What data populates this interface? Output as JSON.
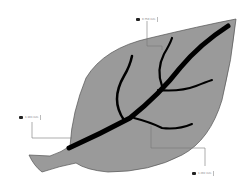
{
  "diagram": {
    "colors": {
      "leaf_fill": "#9a9a9a",
      "leaf_outline": "#555555",
      "veins": "#000000",
      "connector": "#777777"
    },
    "callouts": [
      {
        "id": "top",
        "value": "0.750 mm",
        "icon": "camera-icon"
      },
      {
        "id": "left",
        "value": "1.103 mm",
        "icon": "camera-icon"
      },
      {
        "id": "bottom-right",
        "value": "1.292 mm",
        "icon": "camera-icon"
      }
    ]
  }
}
